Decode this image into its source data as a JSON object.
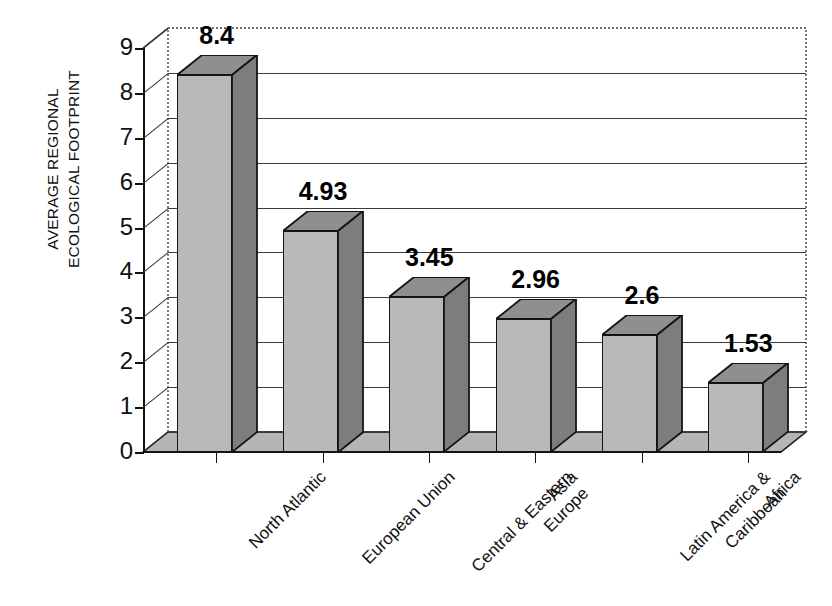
{
  "chart_data": {
    "type": "bar",
    "title": "",
    "subtitle": "",
    "xlabel": "",
    "ylabel": "AVERAGE REGIONAL ECOLOGICAL FOOTPRINT",
    "ylabel_lines": [
      "AVERAGE REGIONAL",
      "ECOLOGICAL FOOTPRINT"
    ],
    "categories": [
      "North Atlantic",
      "European Union",
      "Central & Eastern Europe",
      "Asia",
      "Latin America & Caribbean",
      "Africa"
    ],
    "category_lines": [
      [
        "North Atlantic"
      ],
      [
        "European Union"
      ],
      [
        "Central & Eastern",
        "Europe"
      ],
      [
        "Asia"
      ],
      [
        "Latin America &",
        "Caribbean"
      ],
      [
        "Africa"
      ]
    ],
    "values": [
      8.4,
      4.93,
      3.45,
      2.96,
      2.6,
      1.53
    ],
    "value_labels": [
      "8.4",
      "4.93",
      "3.45",
      "2.96",
      "2.6",
      "1.53"
    ],
    "ylim": [
      0,
      9
    ],
    "yticks": [
      0,
      1,
      2,
      3,
      4,
      5,
      6,
      7,
      8,
      9
    ],
    "ytick_labels": [
      "0",
      "1",
      "2",
      "3",
      "4",
      "5",
      "6",
      "7",
      "8",
      "9"
    ],
    "grid": true,
    "legend": false,
    "style": "3d-column",
    "colors": {
      "bar_front": "#b9b9b9",
      "bar_side": "#7d7d7d",
      "bar_top": "#8f8f8f",
      "floor": "#b5b5b5",
      "floor_left": "#cacaca",
      "outline": "#141414",
      "gridline": "#3a3a3a",
      "background": "#ffffff",
      "text": "#111111"
    }
  }
}
